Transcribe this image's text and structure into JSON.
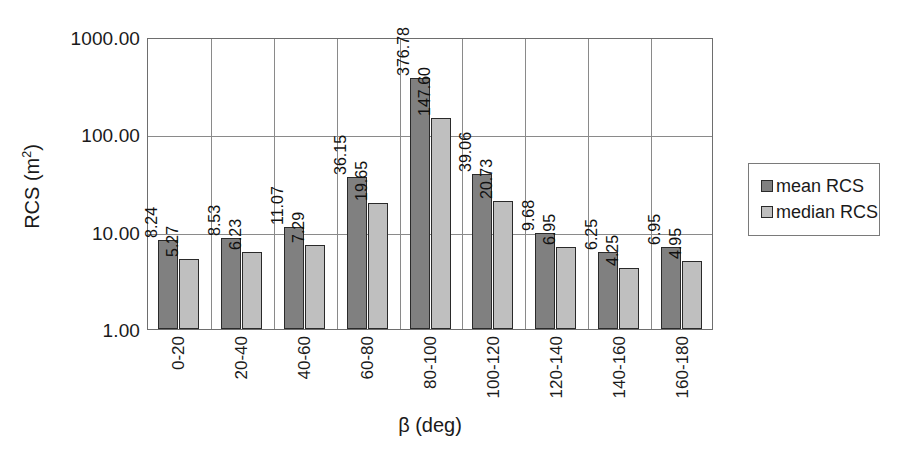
{
  "chart_data": {
    "type": "bar",
    "title": "",
    "xlabel": "β (deg)",
    "ylabel": "RCS (m²)",
    "ylabel_base": "RCS (m",
    "ylabel_sup": "2",
    "ylabel_tail": ")",
    "yscale": "log",
    "ylim": [
      1.0,
      1000.0
    ],
    "ytick_labels": [
      "1000.00",
      "100.00",
      "10.00",
      "1.00"
    ],
    "ytick_values": [
      1000.0,
      100.0,
      10.0,
      1.0
    ],
    "grid": "both",
    "legend_position": "right",
    "categories": [
      "0-20",
      "20-40",
      "40-60",
      "60-80",
      "80-100",
      "100-120",
      "120-140",
      "140-160",
      "160-180"
    ],
    "series": [
      {
        "name": "mean RCS",
        "color": "#808080",
        "values": [
          8.24,
          8.53,
          11.07,
          36.15,
          376.78,
          39.06,
          9.68,
          6.25,
          6.95
        ],
        "labels": [
          "8.24",
          "8.53",
          "11.07",
          "36.15",
          "376.78",
          "39.06",
          "9.68",
          "6.25",
          "6.95"
        ]
      },
      {
        "name": "median RCS",
        "color": "#bfbfbf",
        "values": [
          5.27,
          6.23,
          7.29,
          19.65,
          147.6,
          20.73,
          6.95,
          4.25,
          4.95
        ],
        "labels": [
          "5.27",
          "6.23",
          "7.29",
          "19.65",
          "147.60",
          "20.73",
          "6.95",
          "4.25",
          "4.95"
        ]
      }
    ]
  },
  "legend": {
    "items": [
      {
        "label": "mean RCS",
        "color": "#808080"
      },
      {
        "label": "median RCS",
        "color": "#bfbfbf"
      }
    ]
  }
}
